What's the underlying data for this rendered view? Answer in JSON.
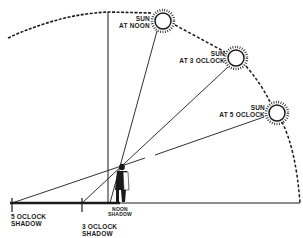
{
  "diagram": {
    "title": "",
    "colors": {
      "ink": "#1a1a1a",
      "background": "#ffffff"
    },
    "suns": [
      {
        "id": "noon",
        "line1": "SUN",
        "line2": "AT NOON"
      },
      {
        "id": "three",
        "line1": "SUN",
        "line2": "AT 3 OCLOCK"
      },
      {
        "id": "five",
        "line1": "SUN",
        "line2": "AT 5 OCLOCK"
      }
    ],
    "shadows": [
      {
        "id": "five",
        "line1": "5 OCLOCK",
        "line2": "SHADOW"
      },
      {
        "id": "three",
        "line1": "3 OCLOCK",
        "line2": "SHADOW"
      },
      {
        "id": "noon",
        "line1": "NOON",
        "line2": "SHADOW"
      }
    ],
    "figure": {
      "label": "person-standing"
    }
  }
}
